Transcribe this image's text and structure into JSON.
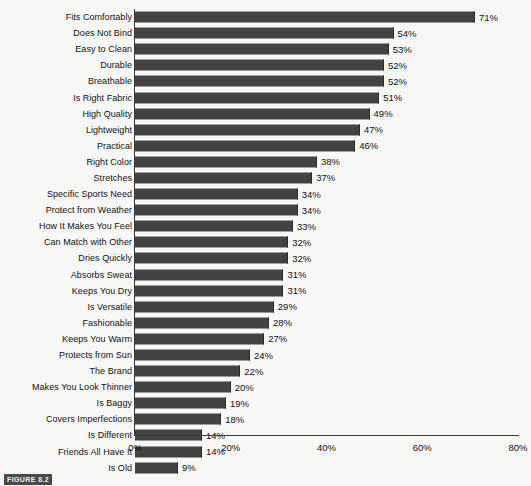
{
  "chart_data": {
    "type": "bar",
    "orientation": "horizontal",
    "title": "",
    "xlabel": "",
    "ylabel": "",
    "xlim": [
      0,
      80
    ],
    "xticks": [
      0,
      20,
      40,
      60,
      80
    ],
    "xtick_labels": [
      "0%",
      "20%",
      "40%",
      "60%",
      "80%"
    ],
    "grid": false,
    "legend": false,
    "value_label_suffix": "%",
    "bar_color": "#434343",
    "axis_color": "#3a3a3a",
    "background_color": "#f7f7f6",
    "categories": [
      "Fits Comfortably",
      "Does Not Bind",
      "Easy to Clean",
      "Durable",
      "Breathable",
      "Is Right Fabric",
      "High Quality",
      "Lightweight",
      "Practical",
      "Right Color",
      "Stretches",
      "Specific Sports Need",
      "Protect from Weather",
      "How It Makes You Feel",
      "Can Match with Other",
      "Dries Quickly",
      "Absorbs Sweat",
      "Keeps You Dry",
      "Is Versatile",
      "Fashionable",
      "Keeps You Warm",
      "Protects from Sun",
      "The Brand",
      "Makes You Look Thinner",
      "Is Baggy",
      "Covers Imperfections",
      "Is Different",
      "Friends All Have It",
      "Is Old"
    ],
    "values": [
      71,
      54,
      53,
      52,
      52,
      51,
      49,
      47,
      46,
      38,
      37,
      34,
      34,
      33,
      32,
      32,
      31,
      31,
      29,
      28,
      27,
      24,
      22,
      20,
      19,
      18,
      14,
      14,
      9
    ],
    "value_labels": [
      "71%",
      "54%",
      "53%",
      "52%",
      "52%",
      "51%",
      "49%",
      "47%",
      "46%",
      "38%",
      "37%",
      "34%",
      "34%",
      "33%",
      "32%",
      "32%",
      "31%",
      "31%",
      "29%",
      "28%",
      "27%",
      "24%",
      "22%",
      "20%",
      "19%",
      "18%",
      "14%",
      "14%",
      "9%"
    ]
  },
  "caption": {
    "figure_label": "FIGURE 8.2",
    "text": ""
  }
}
